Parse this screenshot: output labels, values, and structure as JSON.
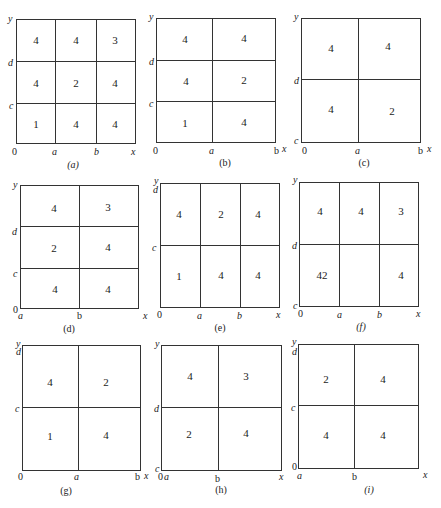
{
  "panels": [
    {
      "id": "a",
      "caption": "(a)",
      "caption_italic": true,
      "labels": {
        "y": "y",
        "x": "x",
        "origin": "0",
        "x1": "a",
        "x2": "b",
        "y1": "c",
        "y2": "d"
      },
      "grid": [
        [
          "4",
          "4",
          "3"
        ],
        [
          "4",
          "2",
          "4"
        ],
        [
          "1",
          "4",
          "4"
        ]
      ]
    },
    {
      "id": "b",
      "caption": "(b)",
      "caption_italic": false,
      "labels": {
        "y": "y",
        "x": "x",
        "origin": "0",
        "x1": "a",
        "x2": "b",
        "y1": "c",
        "y2": "d"
      },
      "grid": [
        [
          "4",
          "4"
        ],
        [
          "4",
          "2"
        ],
        [
          "1",
          "4"
        ]
      ]
    },
    {
      "id": "c",
      "caption": "(c)",
      "caption_italic": false,
      "labels": {
        "y": "y",
        "x": "x",
        "origin": "0",
        "x1": "a",
        "x2": "b",
        "y0": "c",
        "y2": "d"
      },
      "grid": [
        [
          "4",
          "4"
        ],
        [
          "4",
          "2"
        ]
      ]
    },
    {
      "id": "d",
      "caption": "(d)",
      "caption_italic": false,
      "labels": {
        "y": "y",
        "x": "x",
        "origin": "0",
        "x0": "a",
        "x1": "b",
        "y1": "c",
        "y2": "d"
      },
      "grid": [
        [
          "4",
          "3"
        ],
        [
          "2",
          "4"
        ],
        [
          "4",
          "4"
        ]
      ]
    },
    {
      "id": "e",
      "caption": "(e)",
      "caption_italic": false,
      "labels": {
        "y": "y",
        "x": "x",
        "origin": "0",
        "x1": "a",
        "x2": "b",
        "y1": "c",
        "y2": "d"
      },
      "grid": [
        [
          "4",
          "2",
          "4"
        ],
        [
          "1",
          "4",
          "4"
        ]
      ]
    },
    {
      "id": "f",
      "caption": "(f)",
      "caption_italic": true,
      "labels": {
        "y": "y",
        "x": "x",
        "origin": "0",
        "x1": "a",
        "x2": "b",
        "y0": "c",
        "y2": "d"
      },
      "grid": [
        [
          "4",
          "4",
          "3"
        ],
        [
          "42",
          "",
          "4"
        ]
      ]
    },
    {
      "id": "g",
      "caption": "(g)",
      "caption_italic": false,
      "labels": {
        "y": "y",
        "x": "x",
        "origin": "0",
        "x1": "a",
        "x2": "b",
        "y1": "c",
        "y2": "d"
      },
      "grid": [
        [
          "4",
          "2"
        ],
        [
          "1",
          "4"
        ]
      ]
    },
    {
      "id": "h",
      "caption": "(h)",
      "caption_italic": false,
      "labels": {
        "y": "y",
        "x": "x",
        "origin": "0",
        "x0": "a",
        "x1": "b",
        "y0": "c",
        "y2": "d"
      },
      "grid": [
        [
          "4",
          "3"
        ],
        [
          "2",
          "4"
        ]
      ]
    },
    {
      "id": "i",
      "caption": "(i)",
      "caption_italic": true,
      "labels": {
        "y": "y",
        "x": "x",
        "origin": "0",
        "x0": "a",
        "x1": "b",
        "y1": "c",
        "y2": "d"
      },
      "grid": [
        [
          "2",
          "4"
        ],
        [
          "4",
          "4"
        ]
      ]
    }
  ]
}
